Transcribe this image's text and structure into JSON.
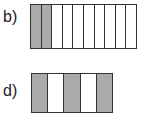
{
  "figures": [
    {
      "label": "b)",
      "columns": 10,
      "shaded": [
        0,
        1
      ],
      "shade_color": "#aaaaaa"
    },
    {
      "label": "d)",
      "columns": 5,
      "shaded": [
        0,
        2,
        4
      ],
      "shade_color": "#aaaaaa"
    }
  ]
}
